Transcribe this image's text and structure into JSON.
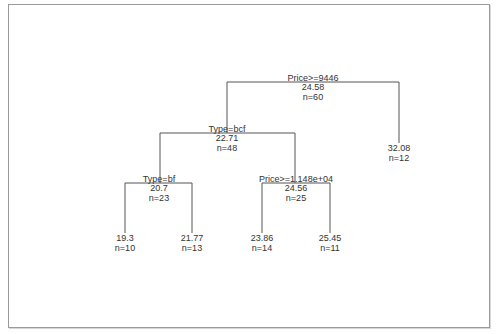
{
  "diagram": {
    "type": "regression-tree",
    "nodes": [
      {
        "id": "root",
        "split": "Price>=9446",
        "value": "24.58",
        "n": "n=60"
      },
      {
        "id": "n2",
        "split": "Type=bcf",
        "value": "22.71",
        "n": "n=48"
      },
      {
        "id": "n3",
        "value": "32.08",
        "n": "n=12"
      },
      {
        "id": "n4",
        "split": "Type=bf",
        "value": "20.7",
        "n": "n=23"
      },
      {
        "id": "n5",
        "split": "Price>=1.148e+04",
        "value": "24.56",
        "n": "n=25"
      },
      {
        "id": "n8",
        "value": "19.3",
        "n": "n=10"
      },
      {
        "id": "n9",
        "value": "21.77",
        "n": "n=13"
      },
      {
        "id": "n10",
        "value": "23.86",
        "n": "n=14"
      },
      {
        "id": "n11",
        "value": "25.45",
        "n": "n=11"
      }
    ],
    "edges": [
      [
        "root",
        "n2"
      ],
      [
        "root",
        "n3"
      ],
      [
        "n2",
        "n4"
      ],
      [
        "n2",
        "n5"
      ],
      [
        "n4",
        "n8"
      ],
      [
        "n4",
        "n9"
      ],
      [
        "n5",
        "n10"
      ],
      [
        "n5",
        "n11"
      ]
    ],
    "line_color": "#555555",
    "text_color": "#333333"
  }
}
